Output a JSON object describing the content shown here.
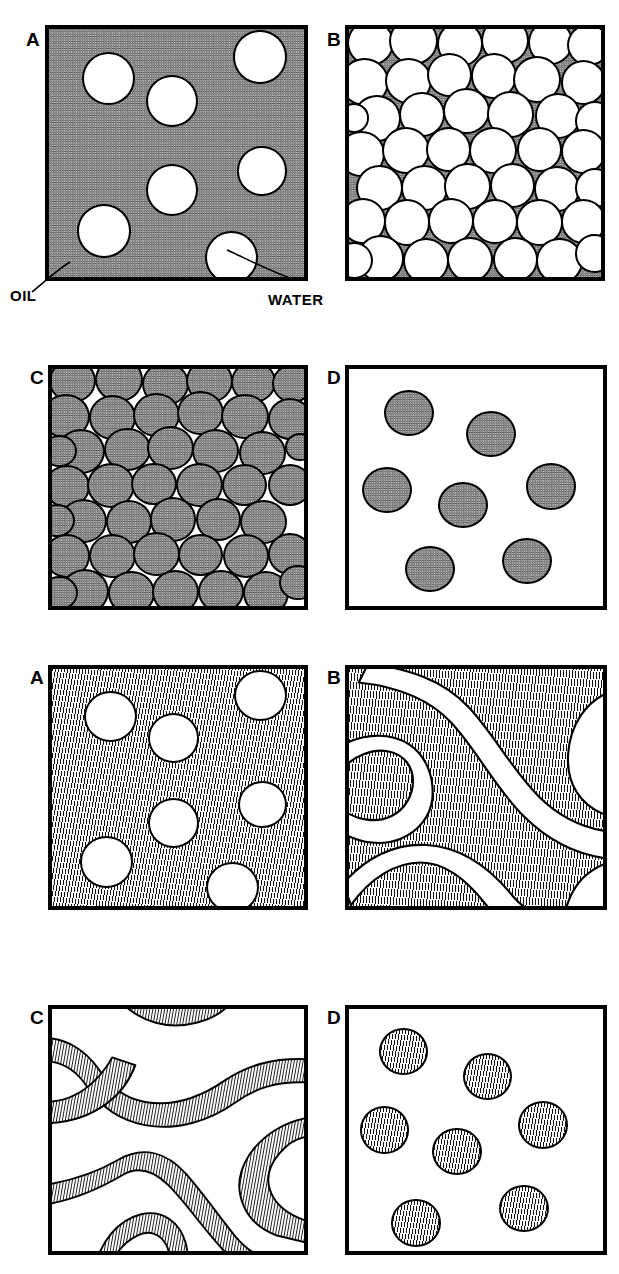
{
  "figure": {
    "width": 619,
    "height": 1274,
    "background": "#ffffff",
    "ink_color": "#000000",
    "gray_fill": "#8d8d8d"
  },
  "annotations": [
    {
      "id": "oil",
      "label": "OIL",
      "points_to": "continuous-phase-matrix",
      "x": 10,
      "y": 288
    },
    {
      "id": "water",
      "label": "WATER",
      "points_to": "dispersed-droplet",
      "x": 268,
      "y": 292
    }
  ],
  "sets": [
    {
      "id": "set-1",
      "texture": "stipple",
      "panels": [
        {
          "letter": "A",
          "name": "dilute-oil-continuous-emulsion",
          "frame": {
            "x": 45,
            "y": 25,
            "w": 263,
            "h": 256
          },
          "label_pos": {
            "x": 26,
            "y": 30
          },
          "fill": "stipple",
          "droplet_style": "white",
          "droplet_count": 7,
          "droplets": [
            {
              "cx": 0.195,
              "cy": 0.245,
              "r": 0.105
            },
            {
              "cx": 0.48,
              "cy": 0.33,
              "r": 0.102
            },
            {
              "cx": 0.83,
              "cy": 0.16,
              "r": 0.105
            },
            {
              "cx": 0.48,
              "cy": 0.69,
              "r": 0.102
            },
            {
              "cx": 0.835,
              "cy": 0.62,
              "r": 0.097
            },
            {
              "cx": 0.215,
              "cy": 0.84,
              "r": 0.105
            },
            {
              "cx": 0.715,
              "cy": 0.945,
              "r": 0.105
            }
          ]
        },
        {
          "letter": "B",
          "name": "concentrated-oil-continuous-emulsion",
          "frame": {
            "x": 345,
            "y": 25,
            "w": 260,
            "h": 256
          },
          "label_pos": {
            "x": 327,
            "y": 30
          },
          "fill": "stipple",
          "droplet_style": "white",
          "droplet_count": 44,
          "packing": "dense-random-close-packed"
        }
      ]
    },
    {
      "id": "set-2",
      "texture": "stipple",
      "panels": [
        {
          "letter": "C",
          "name": "concentrated-water-continuous-emulsion",
          "frame": {
            "x": 48,
            "y": 365,
            "w": 260,
            "h": 245
          },
          "label_pos": {
            "x": 30,
            "y": 368
          },
          "fill": "white",
          "droplet_style": "stipple",
          "droplet_count": 44,
          "packing": "dense-random-close-packed"
        },
        {
          "letter": "D",
          "name": "dilute-water-continuous-emulsion",
          "frame": {
            "x": 345,
            "y": 365,
            "w": 262,
            "h": 245
          },
          "label_pos": {
            "x": 327,
            "y": 368
          },
          "fill": "white",
          "droplet_style": "stipple",
          "droplet_count": 7,
          "droplets": [
            {
              "cx": 0.235,
              "cy": 0.185,
              "r": 0.098
            },
            {
              "cx": 0.56,
              "cy": 0.275,
              "r": 0.098
            },
            {
              "cx": 0.15,
              "cy": 0.51,
              "r": 0.098
            },
            {
              "cx": 0.45,
              "cy": 0.575,
              "r": 0.098
            },
            {
              "cx": 0.795,
              "cy": 0.495,
              "r": 0.098
            },
            {
              "cx": 0.32,
              "cy": 0.845,
              "r": 0.098
            },
            {
              "cx": 0.7,
              "cy": 0.81,
              "r": 0.098
            }
          ]
        }
      ]
    },
    {
      "id": "set-3",
      "texture": "line-hatch",
      "panels": [
        {
          "letter": "A",
          "name": "hatched-dilute-droplet-dispersion",
          "frame": {
            "x": 48,
            "y": 665,
            "w": 260,
            "h": 245
          },
          "label_pos": {
            "x": 30,
            "y": 668
          },
          "fill": "hatch",
          "droplet_style": "white",
          "droplet_count": 7,
          "droplets": [
            {
              "cx": 0.195,
              "cy": 0.245,
              "r": 0.105
            },
            {
              "cx": 0.48,
              "cy": 0.33,
              "r": 0.102
            },
            {
              "cx": 0.83,
              "cy": 0.16,
              "r": 0.105
            },
            {
              "cx": 0.48,
              "cy": 0.69,
              "r": 0.102
            },
            {
              "cx": 0.835,
              "cy": 0.62,
              "r": 0.097
            },
            {
              "cx": 0.215,
              "cy": 0.84,
              "r": 0.105
            },
            {
              "cx": 0.715,
              "cy": 0.945,
              "r": 0.105
            }
          ]
        },
        {
          "letter": "B",
          "name": "bicontinuous-majority-hatched",
          "frame": {
            "x": 345,
            "y": 665,
            "w": 262,
            "h": 245
          },
          "label_pos": {
            "x": 327,
            "y": 668
          },
          "fill": "hatch",
          "structure": "bicontinuous-channels",
          "channel_phase": "white"
        }
      ]
    },
    {
      "id": "set-4",
      "texture": "line-hatch",
      "panels": [
        {
          "letter": "C",
          "name": "bicontinuous-minority-hatched",
          "frame": {
            "x": 48,
            "y": 1005,
            "w": 260,
            "h": 250
          },
          "label_pos": {
            "x": 30,
            "y": 1008
          },
          "fill": "white",
          "structure": "bicontinuous-channels",
          "channel_phase": "hatched"
        },
        {
          "letter": "D",
          "name": "hatched-dilute-droplets-on-white",
          "frame": {
            "x": 345,
            "y": 1005,
            "w": 262,
            "h": 250
          },
          "label_pos": {
            "x": 327,
            "y": 1008
          },
          "fill": "white",
          "droplet_style": "hatch",
          "droplet_count": 7,
          "droplets": [
            {
              "cx": 0.215,
              "cy": 0.175,
              "r": 0.098
            },
            {
              "cx": 0.545,
              "cy": 0.28,
              "r": 0.098
            },
            {
              "cx": 0.14,
              "cy": 0.5,
              "r": 0.098
            },
            {
              "cx": 0.425,
              "cy": 0.59,
              "r": 0.098
            },
            {
              "cx": 0.765,
              "cy": 0.48,
              "r": 0.098
            },
            {
              "cx": 0.265,
              "cy": 0.885,
              "r": 0.098
            },
            {
              "cx": 0.69,
              "cy": 0.825,
              "r": 0.098
            }
          ]
        }
      ]
    }
  ],
  "dense_packing_B": [
    {
      "cx": 0.085,
      "cy": 0.055,
      "r": 0.093
    },
    {
      "cx": 0.255,
      "cy": 0.048,
      "r": 0.098
    },
    {
      "cx": 0.44,
      "cy": 0.06,
      "r": 0.092
    },
    {
      "cx": 0.62,
      "cy": 0.048,
      "r": 0.095
    },
    {
      "cx": 0.8,
      "cy": 0.055,
      "r": 0.09
    },
    {
      "cx": 0.95,
      "cy": 0.065,
      "r": 0.085
    },
    {
      "cx": 0.06,
      "cy": 0.215,
      "r": 0.097
    },
    {
      "cx": 0.235,
      "cy": 0.21,
      "r": 0.093
    },
    {
      "cx": 0.4,
      "cy": 0.185,
      "r": 0.09
    },
    {
      "cx": 0.575,
      "cy": 0.19,
      "r": 0.092
    },
    {
      "cx": 0.745,
      "cy": 0.205,
      "r": 0.095
    },
    {
      "cx": 0.93,
      "cy": 0.215,
      "r": 0.09
    },
    {
      "cx": 0.11,
      "cy": 0.36,
      "r": 0.095
    },
    {
      "cx": 0.29,
      "cy": 0.345,
      "r": 0.09
    },
    {
      "cx": 0.465,
      "cy": 0.33,
      "r": 0.093
    },
    {
      "cx": 0.64,
      "cy": 0.345,
      "r": 0.093
    },
    {
      "cx": 0.83,
      "cy": 0.35,
      "r": 0.092
    },
    {
      "cx": 0.975,
      "cy": 0.37,
      "r": 0.08
    },
    {
      "cx": 0.05,
      "cy": 0.505,
      "r": 0.092
    },
    {
      "cx": 0.225,
      "cy": 0.49,
      "r": 0.095
    },
    {
      "cx": 0.395,
      "cy": 0.485,
      "r": 0.09
    },
    {
      "cx": 0.57,
      "cy": 0.49,
      "r": 0.095
    },
    {
      "cx": 0.755,
      "cy": 0.485,
      "r": 0.09
    },
    {
      "cx": 0.93,
      "cy": 0.495,
      "r": 0.09
    },
    {
      "cx": 0.12,
      "cy": 0.64,
      "r": 0.093
    },
    {
      "cx": 0.3,
      "cy": 0.64,
      "r": 0.092
    },
    {
      "cx": 0.47,
      "cy": 0.635,
      "r": 0.093
    },
    {
      "cx": 0.65,
      "cy": 0.63,
      "r": 0.09
    },
    {
      "cx": 0.825,
      "cy": 0.645,
      "r": 0.092
    },
    {
      "cx": 0.975,
      "cy": 0.64,
      "r": 0.08
    },
    {
      "cx": 0.055,
      "cy": 0.775,
      "r": 0.092
    },
    {
      "cx": 0.23,
      "cy": 0.78,
      "r": 0.093
    },
    {
      "cx": 0.405,
      "cy": 0.775,
      "r": 0.092
    },
    {
      "cx": 0.58,
      "cy": 0.775,
      "r": 0.09
    },
    {
      "cx": 0.755,
      "cy": 0.78,
      "r": 0.093
    },
    {
      "cx": 0.93,
      "cy": 0.775,
      "r": 0.09
    },
    {
      "cx": 0.125,
      "cy": 0.925,
      "r": 0.095
    },
    {
      "cx": 0.305,
      "cy": 0.935,
      "r": 0.092
    },
    {
      "cx": 0.48,
      "cy": 0.93,
      "r": 0.092
    },
    {
      "cx": 0.66,
      "cy": 0.93,
      "r": 0.09
    },
    {
      "cx": 0.835,
      "cy": 0.935,
      "r": 0.092
    },
    {
      "cx": 0.975,
      "cy": 0.905,
      "r": 0.078
    },
    {
      "cx": 0.02,
      "cy": 0.935,
      "r": 0.075
    },
    {
      "cx": 0.02,
      "cy": 0.36,
      "r": 0.06
    }
  ],
  "dense_packing_C": [
    {
      "cx": 0.08,
      "cy": 0.05,
      "r": 0.093
    },
    {
      "cx": 0.265,
      "cy": 0.045,
      "r": 0.095
    },
    {
      "cx": 0.45,
      "cy": 0.065,
      "r": 0.093
    },
    {
      "cx": 0.625,
      "cy": 0.05,
      "r": 0.092
    },
    {
      "cx": 0.8,
      "cy": 0.055,
      "r": 0.09
    },
    {
      "cx": 0.955,
      "cy": 0.06,
      "r": 0.082
    },
    {
      "cx": 0.055,
      "cy": 0.2,
      "r": 0.095
    },
    {
      "cx": 0.24,
      "cy": 0.205,
      "r": 0.095
    },
    {
      "cx": 0.415,
      "cy": 0.195,
      "r": 0.092
    },
    {
      "cx": 0.59,
      "cy": 0.185,
      "r": 0.093
    },
    {
      "cx": 0.765,
      "cy": 0.2,
      "r": 0.095
    },
    {
      "cx": 0.945,
      "cy": 0.21,
      "r": 0.088
    },
    {
      "cx": 0.115,
      "cy": 0.35,
      "r": 0.095
    },
    {
      "cx": 0.3,
      "cy": 0.34,
      "r": 0.092
    },
    {
      "cx": 0.47,
      "cy": 0.335,
      "r": 0.093
    },
    {
      "cx": 0.65,
      "cy": 0.345,
      "r": 0.093
    },
    {
      "cx": 0.835,
      "cy": 0.355,
      "r": 0.092
    },
    {
      "cx": 0.03,
      "cy": 0.345,
      "r": 0.068
    },
    {
      "cx": 0.06,
      "cy": 0.495,
      "r": 0.092
    },
    {
      "cx": 0.235,
      "cy": 0.49,
      "r": 0.095
    },
    {
      "cx": 0.405,
      "cy": 0.485,
      "r": 0.09
    },
    {
      "cx": 0.585,
      "cy": 0.49,
      "r": 0.093
    },
    {
      "cx": 0.765,
      "cy": 0.49,
      "r": 0.09
    },
    {
      "cx": 0.945,
      "cy": 0.49,
      "r": 0.088
    },
    {
      "cx": 0.125,
      "cy": 0.64,
      "r": 0.093
    },
    {
      "cx": 0.305,
      "cy": 0.645,
      "r": 0.092
    },
    {
      "cx": 0.48,
      "cy": 0.635,
      "r": 0.093
    },
    {
      "cx": 0.66,
      "cy": 0.635,
      "r": 0.09
    },
    {
      "cx": 0.84,
      "cy": 0.645,
      "r": 0.092
    },
    {
      "cx": 0.02,
      "cy": 0.64,
      "r": 0.07
    },
    {
      "cx": 0.06,
      "cy": 0.79,
      "r": 0.092
    },
    {
      "cx": 0.24,
      "cy": 0.79,
      "r": 0.093
    },
    {
      "cx": 0.415,
      "cy": 0.78,
      "r": 0.092
    },
    {
      "cx": 0.59,
      "cy": 0.785,
      "r": 0.09
    },
    {
      "cx": 0.77,
      "cy": 0.79,
      "r": 0.093
    },
    {
      "cx": 0.945,
      "cy": 0.78,
      "r": 0.088
    },
    {
      "cx": 0.13,
      "cy": 0.94,
      "r": 0.095
    },
    {
      "cx": 0.315,
      "cy": 0.945,
      "r": 0.092
    },
    {
      "cx": 0.49,
      "cy": 0.94,
      "r": 0.092
    },
    {
      "cx": 0.67,
      "cy": 0.94,
      "r": 0.09
    },
    {
      "cx": 0.85,
      "cy": 0.945,
      "r": 0.092
    },
    {
      "cx": 0.03,
      "cy": 0.945,
      "r": 0.072
    },
    {
      "cx": 0.975,
      "cy": 0.9,
      "r": 0.075
    },
    {
      "cx": 0.985,
      "cy": 0.33,
      "r": 0.06
    }
  ]
}
